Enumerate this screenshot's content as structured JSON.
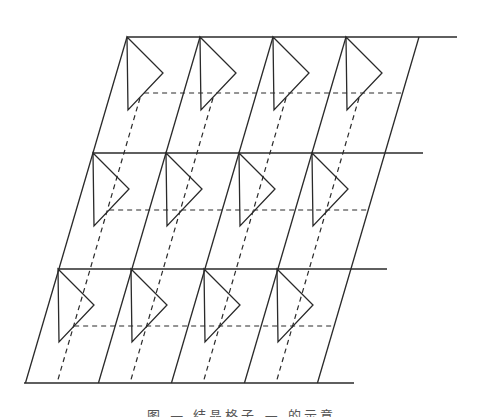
{
  "figure": {
    "type": "oblique lattice diagram with triangles in each cell",
    "colors": {
      "line": "#2a2a2a",
      "background": "#ffffff"
    },
    "geometry": {
      "slope_dx_per_dy": -0.2935,
      "cell_width": 73,
      "rows": [
        {
          "top_y": 37,
          "start_x": 127,
          "line_end_x": 457,
          "dash_y": 93
        },
        {
          "top_y": 153,
          "start_x": 93,
          "line_end_x": 423,
          "dash_y": 210
        },
        {
          "top_y": 269,
          "start_x": 58,
          "line_end_x": 387,
          "dash_y": 326
        }
      ],
      "base": {
        "y": 383,
        "start_x": 24,
        "end_x": 354
      },
      "columns": 4,
      "triangle": {
        "height": 73,
        "right_dx": 36,
        "right_dy": 36,
        "bottom_dx": 1
      },
      "dashed_verticals": {
        "top_y": 98,
        "top_x0": 140,
        "bottom_y": 383,
        "bottom_x0": 57
      }
    }
  },
  "caption": {
    "text": "图 — 结晶格子 — 的示意",
    "clipped": true
  }
}
